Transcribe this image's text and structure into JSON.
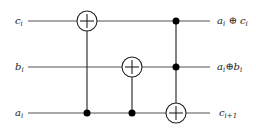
{
  "diagram": {
    "type": "quantum-reversible-circuit",
    "wires": [
      {
        "id": "c",
        "y": 21,
        "input_label": "c",
        "input_sub": "i",
        "output_label": "a",
        "output_sub": "i",
        "output_op": " ⊕ ",
        "output_label2": "c",
        "output_sub2": "i"
      },
      {
        "id": "b",
        "y": 67,
        "input_label": "b",
        "input_sub": "i",
        "output_label": "a",
        "output_sub": "i",
        "output_op": "⊕",
        "output_label2": "b",
        "output_sub2": "i"
      },
      {
        "id": "a",
        "y": 113,
        "input_label": "a",
        "input_sub": "i",
        "output_label": "c",
        "output_sub": "i+1",
        "output_op": "",
        "output_label2": "",
        "output_sub2": ""
      }
    ],
    "gates": [
      {
        "type": "CNOT",
        "x": 87,
        "target_wire": "c",
        "controls": [
          "a"
        ]
      },
      {
        "type": "CNOT",
        "x": 132,
        "target_wire": "b",
        "controls": [
          "a"
        ]
      },
      {
        "type": "Toffoli",
        "x": 176,
        "target_wire": "a",
        "controls": [
          "c",
          "b"
        ]
      }
    ],
    "wire_x_start": 28,
    "wire_x_end": 210,
    "target_radius": 10
  }
}
